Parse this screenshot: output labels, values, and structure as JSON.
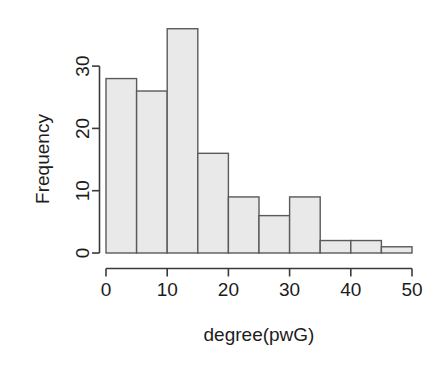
{
  "chart_data": {
    "type": "bar",
    "title": "",
    "subtitle": "",
    "xlabel": "degree(pwG)",
    "ylabel": "Frequency",
    "categories": [
      "0-5",
      "5-10",
      "10-15",
      "15-20",
      "20-25",
      "25-30",
      "30-35",
      "35-40",
      "40-45",
      "45-50"
    ],
    "bin_edges": [
      0,
      5,
      10,
      15,
      20,
      25,
      30,
      35,
      40,
      45,
      50
    ],
    "values": [
      28,
      26,
      36,
      16,
      9,
      6,
      9,
      2,
      2,
      1
    ],
    "xlim": [
      0,
      50
    ],
    "ylim": [
      0,
      36
    ],
    "xticks": [
      0,
      10,
      20,
      30,
      40,
      50
    ],
    "yticks": [
      0,
      10,
      20,
      30
    ],
    "xtick_labels": [
      "0",
      "10",
      "20",
      "30",
      "40",
      "50"
    ],
    "ytick_labels": [
      "0",
      "10",
      "20",
      "30"
    ],
    "grid": false,
    "legend": false,
    "legend_position": "none",
    "bar_fill_color": "#e9e9e9",
    "bar_border_color": "#5a5a5a",
    "axis_color": "#3a3a3a",
    "background_color": "#ffffff",
    "text_color": "#1c1c1c",
    "ylabel_rotation": 90,
    "ytick_label_rotation": 90
  }
}
